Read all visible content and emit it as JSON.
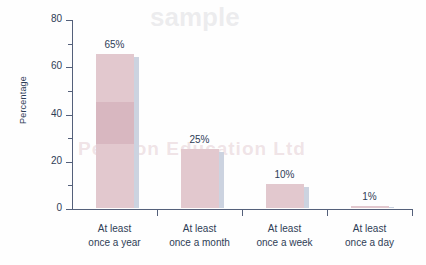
{
  "chart_data": {
    "type": "bar",
    "title": "",
    "xlabel": "",
    "ylabel": "Percentage",
    "categories": [
      "At least once a year",
      "At least once a month",
      "At least once a week",
      "At least once a day"
    ],
    "category_lines": [
      [
        "At least",
        "once a year"
      ],
      [
        "At least",
        "once a month"
      ],
      [
        "At least",
        "once a week"
      ],
      [
        "At least",
        "once a day"
      ]
    ],
    "values": [
      65,
      25,
      10,
      1
    ],
    "data_labels": [
      "65%",
      "25%",
      "10%",
      "1%"
    ],
    "ylim": [
      0,
      80
    ],
    "ytick_labels": [
      "0",
      "20",
      "40",
      "60",
      "80"
    ],
    "ytick_values": [
      0,
      20,
      40,
      60,
      80
    ],
    "yminor_values": [
      10,
      30,
      50,
      70
    ],
    "grid": false,
    "legend": false,
    "legend_position": "none",
    "colors": {
      "bar": "#e2c8ce",
      "bar_shadow": "#ccd3e0",
      "axis": "#54607a",
      "text": "#2e3d56",
      "background": "#fefefe"
    }
  },
  "watermark": {
    "line1": "Pearson Education Ltd",
    "line2": "sample"
  }
}
